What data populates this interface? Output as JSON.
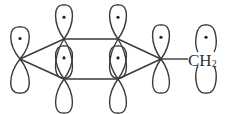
{
  "diagram": {
    "stroke_color": "#3a3a3a",
    "substituent_label": {
      "main": "CH",
      "subscript": "2"
    },
    "orbitals": [
      {
        "id": "ring-left",
        "cx": 20,
        "node_y": 59,
        "up": 32,
        "down": 34,
        "half_width": 11,
        "dot": true
      },
      {
        "id": "ring-top-left",
        "cx": 64,
        "node_y": 39,
        "up": 34,
        "down": 39,
        "half_width": 10,
        "dot": true
      },
      {
        "id": "ring-bottom-left",
        "cx": 64,
        "node_y": 79,
        "up": 33,
        "down": 34,
        "half_width": 10,
        "dot": true
      },
      {
        "id": "ring-top-right",
        "cx": 118,
        "node_y": 39,
        "up": 34,
        "down": 39,
        "half_width": 10,
        "dot": true
      },
      {
        "id": "ring-bottom-right",
        "cx": 118,
        "node_y": 79,
        "up": 33,
        "down": 34,
        "half_width": 10,
        "dot": true
      },
      {
        "id": "ring-right",
        "cx": 161,
        "node_y": 59,
        "up": 34,
        "down": 34,
        "half_width": 10,
        "dot": true
      },
      {
        "id": "ch2-carbon",
        "cx": 206,
        "node_y": 59,
        "up": 34,
        "down": 34,
        "half_width": 10,
        "dot": true,
        "split": true
      }
    ],
    "bonds": [
      {
        "from": [
          20,
          59
        ],
        "to": [
          64,
          39
        ]
      },
      {
        "from": [
          20,
          59
        ],
        "to": [
          64,
          79
        ]
      },
      {
        "from": [
          64,
          39
        ],
        "to": [
          118,
          39
        ]
      },
      {
        "from": [
          64,
          79
        ],
        "to": [
          118,
          79
        ]
      },
      {
        "from": [
          118,
          39
        ],
        "to": [
          161,
          59
        ]
      },
      {
        "from": [
          118,
          79
        ],
        "to": [
          161,
          59
        ]
      },
      {
        "from": [
          161,
          59
        ],
        "to": [
          188,
          59
        ]
      }
    ]
  }
}
